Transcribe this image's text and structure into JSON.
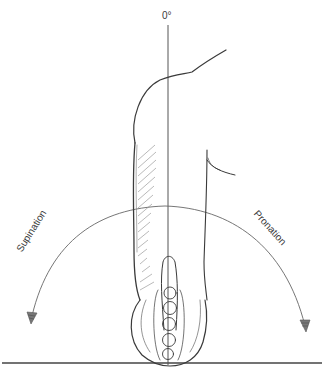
{
  "figure": {
    "type": "forearm rotation range-of-motion diagram",
    "zero_label": "0°",
    "left_label": "Supination",
    "right_label": "Pronation",
    "colors": {
      "line": "#555555",
      "sketch": "#3a3a3a",
      "hatch": "#888888",
      "background": "#ffffff"
    }
  }
}
